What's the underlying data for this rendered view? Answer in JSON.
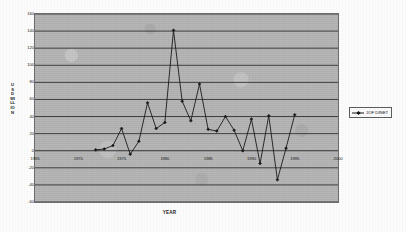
{
  "chart_data": {
    "type": "line",
    "title": "",
    "xlabel": "YEAR",
    "ylabel": "USD MILLION",
    "ylabel_stacked": [
      "U",
      "S",
      "D",
      "MI",
      "LL",
      "IO",
      "N"
    ],
    "xlim": [
      1965,
      2000
    ],
    "ylim": [
      -60,
      160
    ],
    "ytick_step": 20,
    "xtick_step": 5,
    "grid": true,
    "grid_axis": "y",
    "legend_position": "right",
    "legend": [
      "JOF DINET"
    ],
    "series": [
      {
        "name": "JOF DINET",
        "marker": "diamond",
        "color": "#1b1b1b",
        "x": [
          1972,
          1973,
          1974,
          1975,
          1976,
          1977,
          1978,
          1979,
          1980,
          1981,
          1982,
          1983,
          1984,
          1985,
          1986,
          1987,
          1988,
          1989,
          1990,
          1991,
          1992,
          1993,
          1994,
          1995
        ],
        "values": [
          1,
          2,
          6,
          26,
          -4,
          11,
          56,
          26,
          33,
          141,
          58,
          35,
          78,
          25,
          23,
          40,
          24,
          0,
          37,
          -15,
          41,
          -34,
          3,
          42
        ]
      }
    ],
    "xticks": [
      1965,
      1970,
      1975,
      1980,
      1985,
      1990,
      1995,
      2000
    ],
    "xtick_labels": [
      "1965",
      "1970",
      "1975",
      "1980",
      "1985",
      "1990",
      "1995",
      "2000"
    ],
    "yticks": [
      -60,
      -40,
      -20,
      0,
      20,
      40,
      60,
      80,
      100,
      120,
      140,
      160
    ],
    "ytick_labels": [
      "-60",
      "-40",
      "-20",
      "0",
      "20",
      "40",
      "60",
      "80",
      "100",
      "120",
      "140",
      "160"
    ],
    "colors": {
      "plot_background": "#b6b6b6",
      "grid_line": "#2b2b2b",
      "frame": "#6d6d6d",
      "series": "#1b1b1b",
      "text": "#1c1c1c",
      "page_background": "#fdfdfd"
    }
  }
}
